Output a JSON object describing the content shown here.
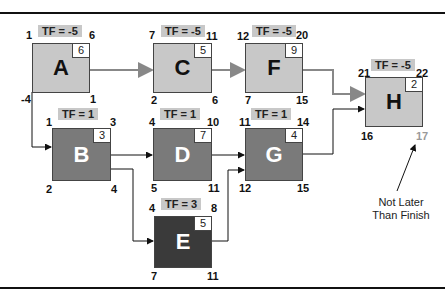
{
  "diagram": {
    "type": "activity-on-node network",
    "nodes": [
      {
        "id": "A",
        "duration": "6",
        "tf": "TF = -5",
        "es": "1",
        "ef": "6",
        "ls": "-4",
        "lf": "1",
        "shade": "light"
      },
      {
        "id": "B",
        "duration": "3",
        "tf": "TF = 1",
        "es": "1",
        "ef": "3",
        "ls": "2",
        "lf": "4",
        "shade": "mid"
      },
      {
        "id": "C",
        "duration": "5",
        "tf": "TF = -5",
        "es": "7",
        "ef": "11",
        "ls": "2",
        "lf": "6",
        "shade": "light"
      },
      {
        "id": "D",
        "duration": "7",
        "tf": "TF = 1",
        "es": "4",
        "ef": "10",
        "ls": "5",
        "lf": "11",
        "shade": "mid"
      },
      {
        "id": "E",
        "duration": "5",
        "tf": "TF = 3",
        "es": "4",
        "ef": "8",
        "ls": "7",
        "lf": "11",
        "shade": "dark"
      },
      {
        "id": "F",
        "duration": "9",
        "tf": "TF = -5",
        "es": "12",
        "ef": "20",
        "ls": "7",
        "lf": "15",
        "shade": "light"
      },
      {
        "id": "G",
        "duration": "4",
        "tf": "TF = 1",
        "es": "11",
        "ef": "14",
        "ls": "12",
        "lf": "15",
        "shade": "mid"
      },
      {
        "id": "H",
        "duration": "2",
        "tf": "TF = -5",
        "es": "21",
        "ef": "22",
        "ls": "16",
        "lf": "17",
        "shade": "light"
      }
    ],
    "edges": [
      {
        "from": "A",
        "to": "C",
        "style": "grey"
      },
      {
        "from": "C",
        "to": "F",
        "style": "grey"
      },
      {
        "from": "F",
        "to": "H",
        "style": "grey"
      },
      {
        "from": "A",
        "to": "B",
        "style": "black"
      },
      {
        "from": "B",
        "to": "D",
        "style": "black"
      },
      {
        "from": "B",
        "to": "E",
        "style": "black"
      },
      {
        "from": "D",
        "to": "G",
        "style": "black"
      },
      {
        "from": "E",
        "to": "G",
        "style": "black"
      },
      {
        "from": "G",
        "to": "H",
        "style": "black"
      }
    ],
    "annotation": {
      "line1": "Not Later",
      "line2": "Than Finish",
      "target": "H late finish 17"
    },
    "colors": {
      "light": "#c8c8c8",
      "mid": "#7a7a7a",
      "dark": "#3a3a3a",
      "grey_arrow": "#888888",
      "black_arrow": "#111111"
    }
  }
}
